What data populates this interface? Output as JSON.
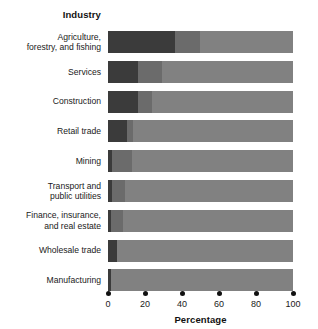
{
  "chart_data": {
    "type": "bar",
    "orientation": "horizontal",
    "stacked": true,
    "title": "",
    "xlabel": "Percentage",
    "ylabel": "Industry",
    "xlim": [
      0,
      100
    ],
    "xticks": [
      0,
      20,
      40,
      60,
      80,
      100
    ],
    "xtick_labels": [
      "0",
      "20",
      "40",
      "60",
      "80",
      "100"
    ],
    "grid": false,
    "legend": "none",
    "categories": [
      "Agriculture, forestry, and fishing",
      "Services",
      "Construction",
      "Retail trade",
      "Mining",
      "Transport and public utilities",
      "Finance, insurance, and real estate",
      "Wholesale trade",
      "Manufacturing"
    ],
    "category_lines": [
      [
        "Agriculture,",
        "forestry, and fishing"
      ],
      [
        "Services"
      ],
      [
        "Construction"
      ],
      [
        "Retail trade"
      ],
      [
        "Mining"
      ],
      [
        "Transport and",
        "public utilities"
      ],
      [
        "Finance, insurance,",
        "and real estate"
      ],
      [
        "Wholesale trade"
      ],
      [
        "Manufacturing"
      ]
    ],
    "series": [
      {
        "name": "segment-1",
        "color": "#3b3b3b",
        "values": [
          36,
          16,
          16,
          10,
          2,
          2,
          1.5,
          5,
          1.5
        ]
      },
      {
        "name": "segment-2",
        "color": "#6b6b6b",
        "values": [
          14,
          13,
          8,
          3.5,
          11,
          7,
          6.5,
          0,
          0
        ]
      },
      {
        "name": "segment-3",
        "color": "#818181",
        "values": [
          50,
          71,
          76,
          86.5,
          87,
          91,
          92,
          95,
          98.5
        ]
      }
    ],
    "colors": {
      "segment_1": "#3b3b3b",
      "segment_2": "#6b6b6b",
      "segment_3": "#818181",
      "background": "#ffffff",
      "text": "#1a1a1a"
    }
  }
}
